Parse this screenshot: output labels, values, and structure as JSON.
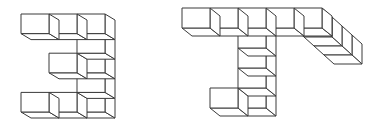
{
  "stroke_color": "#3a3a3a",
  "background_color": "#ffffff",
  "figures": [
    {
      "id": "figure-left",
      "label": "Figure 1",
      "description": "E-shaped cube structure (mirrored '3'), 5 rows tall",
      "cube_size": {
        "w": 28,
        "h": 19.6
      },
      "depth_offset": {
        "dx": 10,
        "dy": 6
      },
      "cubes": [
        {
          "col": 0,
          "row": 0
        },
        {
          "col": 1,
          "row": 0
        },
        {
          "col": 2,
          "row": 0
        },
        {
          "col": 2,
          "row": 1
        },
        {
          "col": 1,
          "row": 2
        },
        {
          "col": 2,
          "row": 2
        },
        {
          "col": 2,
          "row": 3
        },
        {
          "col": 0,
          "row": 4
        },
        {
          "col": 1,
          "row": 4
        },
        {
          "col": 2,
          "row": 4
        }
      ],
      "cube_count": 10
    },
    {
      "id": "figure-right",
      "label": "Figure 2",
      "description": "T-shaped cube structure with a foot and a receding arm",
      "cube_size": {
        "w": 28,
        "h": 20
      },
      "depth_offset": {
        "dx": 10,
        "dy": 8
      },
      "cubes": [
        {
          "col": 0,
          "row": 0
        },
        {
          "col": 1,
          "row": 0
        },
        {
          "col": 2,
          "row": 0
        },
        {
          "col": 3,
          "row": 0
        },
        {
          "col": 4,
          "row": 0
        },
        {
          "col": 2,
          "row": 1
        },
        {
          "col": 2,
          "row": 2
        },
        {
          "col": 2,
          "row": 3
        },
        {
          "col": 1,
          "row": 4
        },
        {
          "col": 2,
          "row": 4
        }
      ],
      "arm_depth_cubes": 4,
      "cube_count": 14
    }
  ]
}
